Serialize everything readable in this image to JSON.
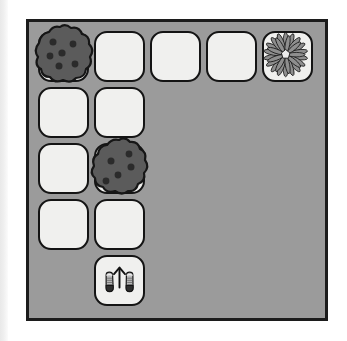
{
  "scene": {
    "type": "grid-path-puzzle",
    "title": "Cookie path puzzle board",
    "board": {
      "columns": 5,
      "rows": 5,
      "background_color": "#9b9b9b",
      "border_color": "#1c1c1c",
      "tile_color": "#f0f0ee",
      "tile_border_color": "#141414"
    },
    "colors": {
      "cookie_body": "#5b5b5b",
      "cookie_chip": "#2b2b2b",
      "cookie_outline": "#161616",
      "flower_petal": "#8e8e8e",
      "flower_center": "#e8e8e8",
      "shoe_body": "#b9b9b9",
      "shoe_sole": "#2e2e2e",
      "arrow": "#121212",
      "page_edge": "#ececec"
    }
  },
  "tiles": [
    {
      "name": "tile-r0-c0",
      "row": 0,
      "col": 0,
      "content": "empty"
    },
    {
      "name": "tile-r0-c1",
      "row": 0,
      "col": 1,
      "content": "empty"
    },
    {
      "name": "tile-r0-c2",
      "row": 0,
      "col": 2,
      "content": "empty"
    },
    {
      "name": "tile-r0-c3",
      "row": 0,
      "col": 3,
      "content": "empty"
    },
    {
      "name": "tile-r0-c4",
      "row": 0,
      "col": 4,
      "content": "flower"
    },
    {
      "name": "tile-r1-c0",
      "row": 1,
      "col": 0,
      "content": "empty"
    },
    {
      "name": "tile-r1-c1",
      "row": 1,
      "col": 1,
      "content": "empty"
    },
    {
      "name": "tile-r2-c0",
      "row": 2,
      "col": 0,
      "content": "empty"
    },
    {
      "name": "tile-r2-c1",
      "row": 2,
      "col": 1,
      "content": "empty"
    },
    {
      "name": "tile-r3-c0",
      "row": 3,
      "col": 0,
      "content": "empty"
    },
    {
      "name": "tile-r3-c1",
      "row": 3,
      "col": 1,
      "content": "empty"
    },
    {
      "name": "tile-r4-c1",
      "row": 4,
      "col": 1,
      "content": "start-shoes"
    }
  ],
  "items": {
    "cookies": [
      {
        "name": "cookie-top-left",
        "row": 0,
        "col": 0,
        "chips": 5
      },
      {
        "name": "cookie-middle",
        "row": 2,
        "col": 1,
        "chips": 5
      }
    ],
    "goal": {
      "name": "flower-goal",
      "row": 0,
      "col": 4,
      "petals": 18
    },
    "start": {
      "name": "start-marker",
      "row": 4,
      "col": 1,
      "direction": "up",
      "icon": "sneakers-with-up-arrow"
    }
  }
}
